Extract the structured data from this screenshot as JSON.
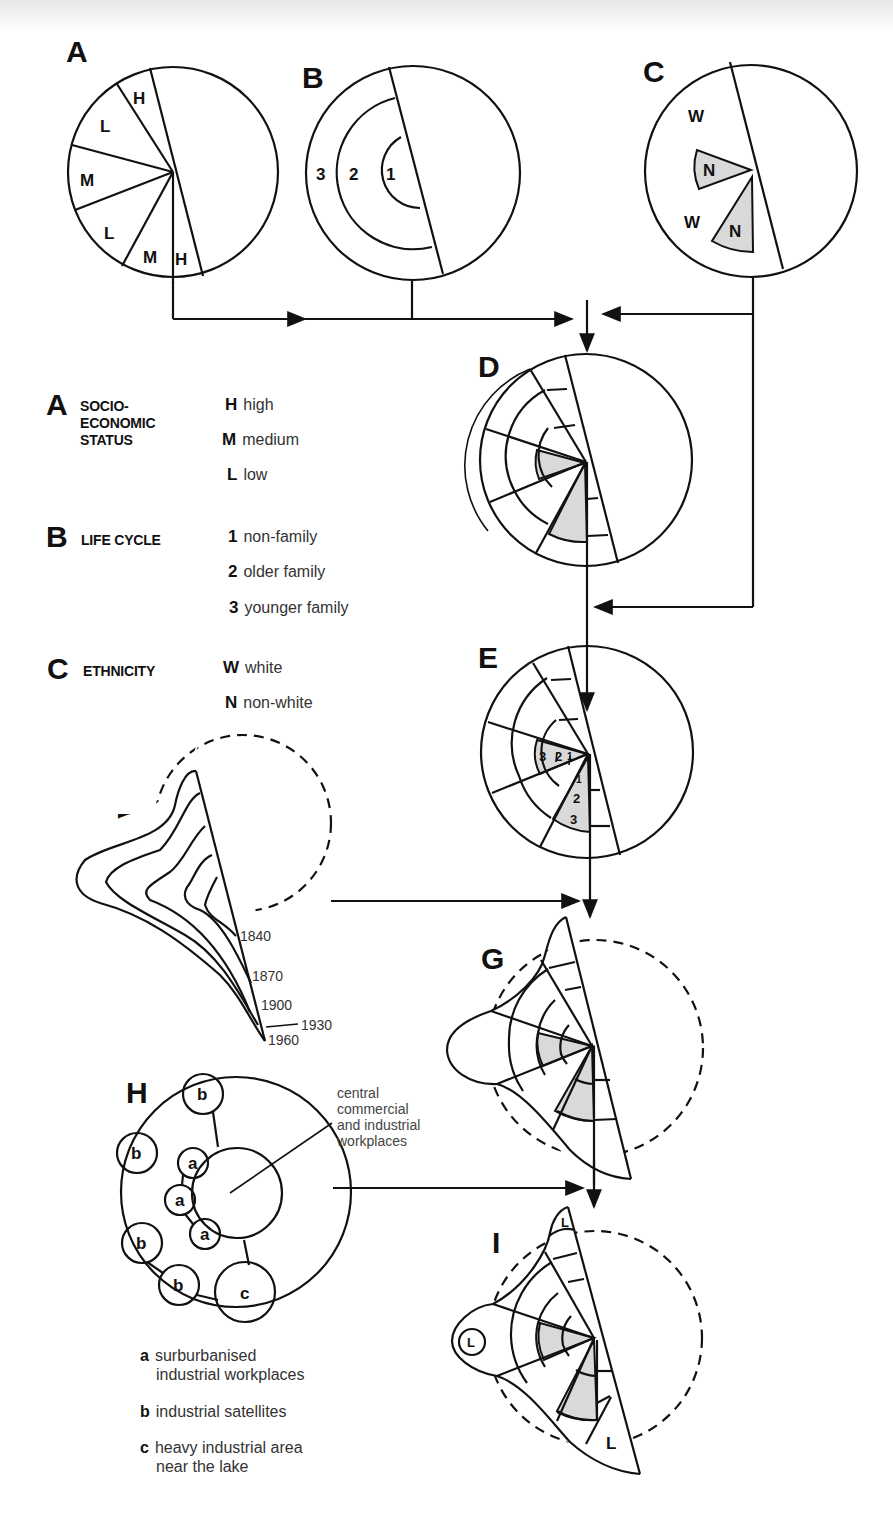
{
  "figure": {
    "panels": [
      "A",
      "B",
      "C",
      "D",
      "E",
      "F",
      "G",
      "H",
      "I"
    ],
    "panel_A": {
      "label": "A",
      "segments": [
        "H",
        "L",
        "M",
        "L",
        "M",
        "H"
      ]
    },
    "panel_B": {
      "label": "B",
      "rings": [
        "1",
        "2",
        "3"
      ]
    },
    "panel_C": {
      "label": "C",
      "segments": [
        "W",
        "N",
        "W",
        "N"
      ]
    },
    "panel_D": {
      "label": "D"
    },
    "panel_E": {
      "label": "E",
      "ring_labels_upper": [
        "3",
        "2",
        "1"
      ],
      "ring_labels_lower": [
        "1",
        "2",
        "3"
      ]
    },
    "panel_F": {
      "label": "F",
      "years": [
        "1840",
        "1870",
        "1900",
        "1930",
        "1960"
      ]
    },
    "panel_G": {
      "label": "G"
    },
    "panel_H": {
      "label": "H",
      "nodes": [
        "b",
        "b",
        "b",
        "b",
        "a",
        "a",
        "a",
        "c"
      ],
      "callout": "central commercial and industrial workplaces"
    },
    "panel_I": {
      "label": "I",
      "zones": [
        "L",
        "L",
        "L"
      ]
    }
  },
  "legend": {
    "A": {
      "letter": "A",
      "title_lines": [
        "SOCIO-",
        "ECONOMIC",
        "STATUS"
      ],
      "items": [
        {
          "key": "H",
          "text": "high"
        },
        {
          "key": "M",
          "text": "medium"
        },
        {
          "key": "L",
          "text": "low"
        }
      ]
    },
    "B": {
      "letter": "B",
      "title_lines": [
        "LIFE CYCLE"
      ],
      "items": [
        {
          "key": "1",
          "text": "non-family"
        },
        {
          "key": "2",
          "text": "older family"
        },
        {
          "key": "3",
          "text": "younger family"
        }
      ]
    },
    "C": {
      "letter": "C",
      "title_lines": [
        "ETHNICITY"
      ],
      "items": [
        {
          "key": "W",
          "text": "white"
        },
        {
          "key": "N",
          "text": "non-white"
        }
      ]
    }
  },
  "h_key": [
    {
      "key": "a",
      "lines": [
        "surburbanised",
        "industrial workplaces"
      ]
    },
    {
      "key": "b",
      "lines": [
        "industrial satellites"
      ]
    },
    {
      "key": "c",
      "lines": [
        "heavy industrial area",
        "near the lake"
      ]
    }
  ],
  "h_callout_lines": [
    "central",
    "commercial",
    "and industrial",
    "workplaces"
  ],
  "colors": {
    "ink": "#111111",
    "shade": "#d9d9d9",
    "paper": "#ffffff"
  }
}
